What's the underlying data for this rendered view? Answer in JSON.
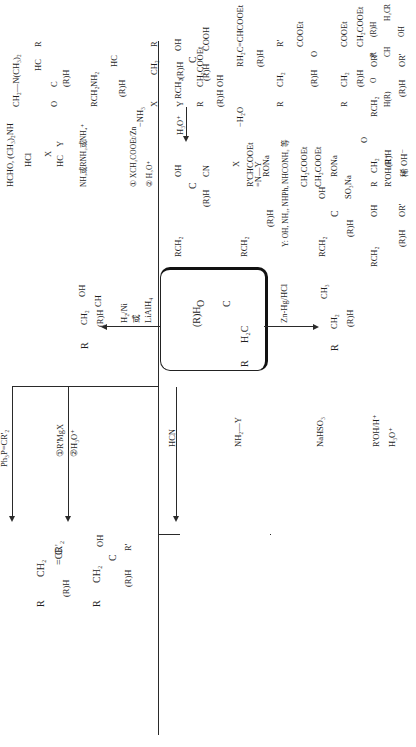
{
  "page": {
    "orientation": "rotated 90deg counterclockwise",
    "background": "#ffffff",
    "ink": "#1f1f1f"
  },
  "center": {
    "compound": {
      "R": "R",
      "CH2": "H₂C",
      "C": "C",
      "O": "O",
      "RH": "(R)H"
    }
  },
  "reduction_alcohol": {
    "reagent_line1": "H₂/Ni",
    "reagent_line2": "或",
    "reagent_line3": "LiAlH₄",
    "product": {
      "R": "R",
      "CH2": "CH₂",
      "CH": "CH",
      "OH": "OH",
      "RH": "(R)H"
    }
  },
  "clemmensen": {
    "reagent": "Zn-Hg/HCl",
    "product": {
      "R": "R",
      "CH2": "CH₂",
      "CH3": "CH₃",
      "RH": "(R)H"
    }
  },
  "top_branches": [
    {
      "id": "wittig",
      "reagent": "Ph₃P=CR'₂",
      "product": {
        "R": "R",
        "CH2": "CH₂",
        "C": "C",
        "alkene": "=CR'₂",
        "RH": "(R)H"
      }
    },
    {
      "id": "grignard",
      "reagent_line1": "①R'MgX",
      "reagent_line2": "②H₃O⁺",
      "product": {
        "R": "R",
        "CH2": "CH₂",
        "C": "C",
        "OH": "OH",
        "Rp": "R'",
        "RH": "(R)H"
      }
    },
    {
      "id": "cyanohydrin",
      "reagent": "HCN",
      "product": {
        "RCH2": "RCH₂",
        "C": "C",
        "OH": "OH",
        "CN": "CN",
        "RH": "(R)H"
      },
      "followup_reagent": "H₃O⁺",
      "followup_product": {
        "RCH2": "RCH₂",
        "C": "C",
        "OH": "OH",
        "COOH": "COOH",
        "RH": "(R)H"
      }
    },
    {
      "id": "imine",
      "reagent": "NH₂—Y",
      "product": {
        "RCH2": "RCH₂",
        "C": "C",
        "N": "=N—Y",
        "RH": "(R)H"
      },
      "note": "Y: OH, NH₂, NHPh, NHCONH₂ 等"
    },
    {
      "id": "bisulfite",
      "reagent": "NaHSO₃",
      "product": {
        "RCH2": "RCH₂",
        "C": "C",
        "OH": "OH",
        "SO3Na": "SO₃Na",
        "RH": "(R)H"
      }
    },
    {
      "id": "acetal",
      "reagent_fwd": "R'OH/H⁺",
      "reagent_rev": "H₃O⁺",
      "hemiacetal": {
        "RCH2": "RCH₂",
        "C": "C",
        "OH": "OH",
        "ORp": "OR'",
        "RH": "(R)H"
      },
      "reagent2": "R'OH/H⁺",
      "acetal": {
        "RCH2": "RCH₂",
        "C": "C",
        "OR1": "OR'",
        "OR2": "OR'",
        "RH": "(R)H"
      }
    }
  ],
  "bottom_branches": [
    {
      "id": "mannich",
      "reagent_line1": "HCHO, (CH₃)₂NH",
      "reagent_line2": "HCl",
      "product": {
        "CH2N": "CH₂—N(CH₃)₂",
        "R": "R",
        "HC": "HC",
        "C": "C",
        "O": "O",
        "RH": "(R)H"
      }
    },
    {
      "id": "amination",
      "reagent_top_X": "X",
      "reagent_top_HC": "HC",
      "reagent_top_Y": "Y",
      "reagent_line2": "NH₃或RNH₂或NH₄⁺",
      "product": {
        "RCH2": "RCH₂",
        "C": "C",
        "NH2": "NH₂",
        "HC": "HC",
        "X": "X",
        "Y": "Y",
        "RH": "(R)H"
      },
      "followup_reagent": "−NH₃",
      "followup_product": {
        "R": "R",
        "CH2": "CH₂",
        "C": "C",
        "C2": "C",
        "X": "X",
        "Y": "Y",
        "RH": "(R)H"
      }
    },
    {
      "id": "reformatsky",
      "reagent_line1": "① XCH₂COOEt/Zn",
      "reagent_line2": "② H₃O⁺",
      "product": {
        "R": "R",
        "CH2": "CH₂",
        "C": "C",
        "CH2COOEt": "CH₂COOEt",
        "OH": "OH",
        "RH": "(R)H"
      },
      "followup_reagent": "−H₂O",
      "followup_product": {
        "RH2C": "RH₂C",
        "C": "C",
        "CHCOOEt": "=CHCOOEt",
        "RH": "(R)H"
      }
    },
    {
      "id": "darzens",
      "reagent_X": "X",
      "reagent_line1": "R'CHCOOEt",
      "reagent_line2": "RONa",
      "product": {
        "R": "R",
        "CH2": "CH₂",
        "C": "C",
        "Rp": "R'",
        "COOEt": "COOEt",
        "O": "O",
        "RH": "(R)H"
      }
    },
    {
      "id": "stobbe",
      "reagent_line1": "CH₂COOEt",
      "reagent_line2": "CH₂COOEt",
      "reagent_line3": "RONa",
      "product": {
        "R": "R",
        "CH2": "CH₂",
        "C": "C",
        "COOEt": "COOEt",
        "CH2COOEt": "CH₂COOEt",
        "RH": "(R)H"
      }
    },
    {
      "id": "aldol",
      "reagent_mol": {
        "R": "R",
        "CH2": "CH₂",
        "C": "C",
        "O": "O",
        "RH": "(R)H"
      },
      "reagent_cond": "稀 OH⁻",
      "product": {
        "R": "R",
        "H2C": "H₂C",
        "C": "C",
        "RH": "(R)H",
        "OH": "OH",
        "Rsub": "R",
        "CH": "CH",
        "C2": "C",
        "O": "O",
        "HR": "H(R)"
      },
      "followup_reagent": "−H₂O",
      "followup_product": {
        "RH2C": "RH₂C",
        "C": "C",
        "RH": "(R)H",
        "Rsub": "R",
        "C2": "C",
        "C3": "C",
        "O": "O",
        "HR": "H(R)"
      }
    }
  ]
}
